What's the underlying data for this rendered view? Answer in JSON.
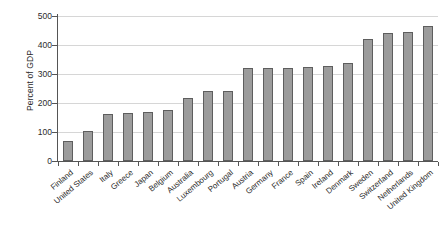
{
  "chart_data": {
    "type": "bar",
    "title": "",
    "subtitle": "",
    "xlabel": "",
    "ylabel": "Percent of GDP",
    "ylim": [
      0,
      500
    ],
    "ytick_labels": [
      "0",
      "100",
      "200",
      "300",
      "400",
      "500"
    ],
    "ytick_values": [
      0,
      100,
      200,
      300,
      400,
      500
    ],
    "grid": true,
    "legend": null,
    "legend_position": "none",
    "bar_color": "#9c9c9c",
    "bar_edge_color": "#5e5e5e",
    "gridline_color": "#d6d6d6",
    "axis_color": "#555555",
    "categories": [
      "Finland",
      "United States",
      "Italy",
      "Greece",
      "Japan",
      "Belgium",
      "Australia",
      "Luxembourg",
      "Portugal",
      "Austria",
      "Germany",
      "France",
      "Spain",
      "Ireland",
      "Denmark",
      "Sweden",
      "Switzerland",
      "Netherlands",
      "United Kingdom"
    ],
    "values": [
      70,
      103,
      163,
      165,
      170,
      176,
      218,
      240,
      243,
      320,
      322,
      322,
      325,
      328,
      337,
      420,
      440,
      445,
      467
    ]
  }
}
